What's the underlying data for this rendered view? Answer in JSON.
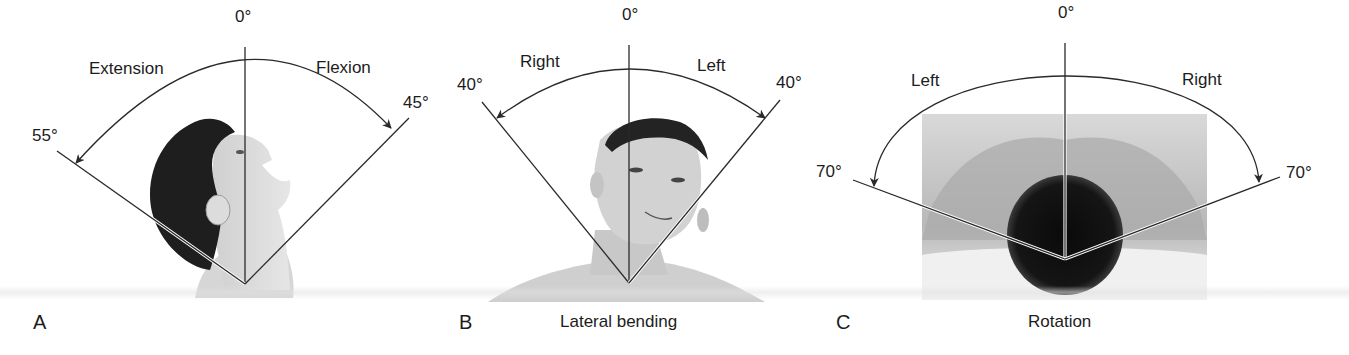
{
  "figure": {
    "panels": [
      {
        "id": "A",
        "letter": "A",
        "caption": "",
        "zero_label": "0°",
        "left_direction": "Extension",
        "right_direction": "Flexion",
        "left_angle": "55°",
        "right_angle": "45°",
        "left_angle_value": 55,
        "right_angle_value": 45,
        "subject": "profile view of man's head tilted back (neck extension)"
      },
      {
        "id": "B",
        "letter": "B",
        "caption": "Lateral bending",
        "zero_label": "0°",
        "left_direction": "Right",
        "right_direction": "Left",
        "left_angle": "40°",
        "right_angle": "40°",
        "left_angle_value": 40,
        "right_angle_value": 40,
        "subject": "frontal view of man's head bent laterally"
      },
      {
        "id": "C",
        "letter": "C",
        "caption": "Rotation",
        "zero_label": "0°",
        "left_direction": "Left",
        "right_direction": "Right",
        "left_angle": "70°",
        "right_angle": "70°",
        "left_angle_value": 70,
        "right_angle_value": 70,
        "subject": "top-down view of man's head and shoulders lying on a pillow"
      }
    ],
    "colors": {
      "line": "#2a2a2a",
      "text": "#1c1c1c",
      "background": "#ffffff"
    }
  }
}
